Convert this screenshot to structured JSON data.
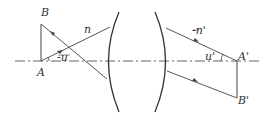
{
  "diagram": {
    "type": "optical-imaging-thick-lens",
    "colors": {
      "line": "#444444",
      "axis": "#555555",
      "label": "#333333",
      "background": "#ffffff"
    },
    "labels": {
      "object_top": "B",
      "object_base": "A",
      "object_index": "n",
      "object_angle": "-u",
      "image_index": "-n'",
      "image_angle": "u'",
      "image_base": "A'",
      "image_top": "B'"
    }
  }
}
